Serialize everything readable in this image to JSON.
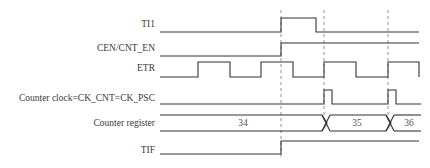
{
  "diagram": {
    "type": "timing-diagram",
    "colors": {
      "line": "#333333",
      "text": "#3a3a3a",
      "dashed": "#777777",
      "background": "#ffffff"
    },
    "signals": [
      {
        "id": "ti1",
        "label": "TI1"
      },
      {
        "id": "cen",
        "label": "CEN/CNT_EN"
      },
      {
        "id": "etr",
        "label": "ETR"
      },
      {
        "id": "ck_cnt",
        "label": "Counter clock=CK_CNT=CK_PSC"
      },
      {
        "id": "cnt_reg",
        "label": "Counter register",
        "values": [
          "34",
          "35",
          "36"
        ]
      },
      {
        "id": "tif",
        "label": "TIF"
      }
    ]
  }
}
